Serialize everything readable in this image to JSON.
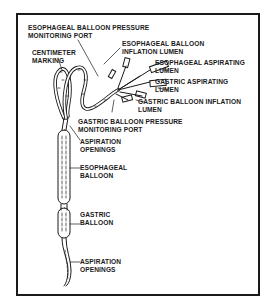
{
  "diagram": {
    "labels": [
      {
        "id": "esophageal-balloon-pressure-port",
        "lines": [
          "ESOPHAGEAL BALLOON PRESSURE",
          "MONITORING PORT"
        ]
      },
      {
        "id": "esophageal-balloon-inflation-lumen",
        "lines": [
          "ESOPHAGEAL BALLOON",
          "INFLATION LUMEN"
        ]
      },
      {
        "id": "centimeter-marking",
        "lines": [
          "CENTIMETER",
          "MARKING"
        ]
      },
      {
        "id": "esophageal-aspirating-lumen",
        "lines": [
          "ESOPHAGEAL ASPIRATING",
          "LUMEN"
        ]
      },
      {
        "id": "gastric-aspirating-lumen",
        "lines": [
          "GASTRIC ASPIRATING",
          "LUMEN"
        ]
      },
      {
        "id": "gastric-balloon-inflation-lumen",
        "lines": [
          "GASTRIC BALLOON INFLATION",
          "LUMEN"
        ]
      },
      {
        "id": "gastric-balloon-pressure-port",
        "lines": [
          "GASTRIC BALLOON PRESSURE",
          "MONITORING PORT"
        ]
      },
      {
        "id": "aspiration-openings-upper",
        "lines": [
          "ASPIRATION",
          "OPENINGS"
        ]
      },
      {
        "id": "esophageal-balloon",
        "lines": [
          "ESOPHAGEAL",
          "BALLOON"
        ]
      },
      {
        "id": "gastric-balloon",
        "lines": [
          "GASTRIC",
          "BALLOON"
        ]
      },
      {
        "id": "aspiration-openings-lower",
        "lines": [
          "ASPIRATION",
          "OPENINGS"
        ]
      }
    ]
  },
  "colors": {
    "ink": "#1a1a1a",
    "background": "#ffffff"
  }
}
